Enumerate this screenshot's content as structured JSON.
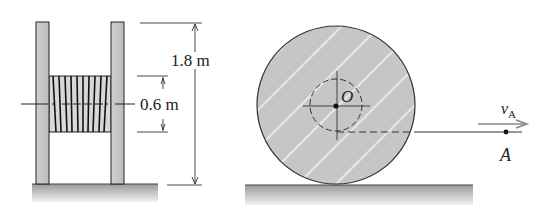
{
  "figure": {
    "left_view": {
      "outer_dimension": "1.8 m",
      "inner_dimension": "0.6 m"
    },
    "right_view": {
      "center_label": "O",
      "velocity_label": "v",
      "velocity_subscript": "A",
      "point_label": "A"
    }
  },
  "colors": {
    "fill_gray": "#c9c9c9",
    "line": "#333333",
    "ground": "#b8b8b8"
  }
}
